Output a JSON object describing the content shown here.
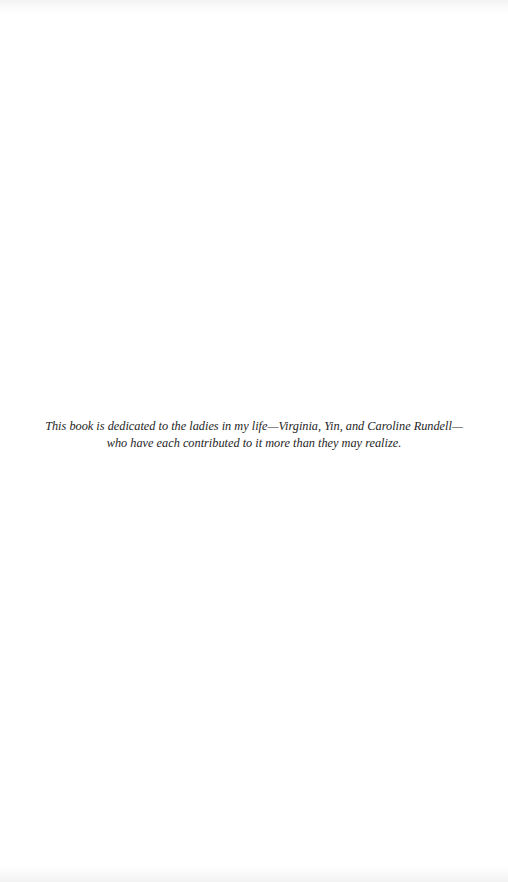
{
  "page": {
    "background": "#ffffff",
    "text_color": "#1e1e1e"
  },
  "dedication": {
    "line1": "This book is dedicated to the ladies in my life—Virginia, Yin, and Caroline Rundell—",
    "line2": "who have each contributed to it more than they may realize."
  }
}
